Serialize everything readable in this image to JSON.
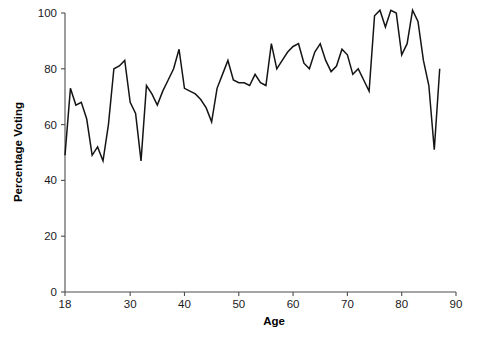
{
  "chart_data": {
    "type": "line",
    "title": "",
    "xlabel": "Age",
    "ylabel": "Percentage Voting",
    "xlim": [
      18,
      90
    ],
    "ylim": [
      0,
      100
    ],
    "grid": false,
    "legend": null,
    "xticks": [
      18,
      30,
      40,
      50,
      60,
      70,
      80,
      90
    ],
    "xtick_labels": [
      "18",
      "30",
      "40",
      "50",
      "60",
      "70",
      "80",
      "90"
    ],
    "yticks": [
      0,
      20,
      40,
      60,
      80,
      100
    ],
    "ytick_labels": [
      "0",
      "20",
      "40",
      "60",
      "80",
      "100"
    ],
    "series": [
      {
        "name": "Percentage Voting",
        "color": "#141414",
        "x": [
          18,
          19,
          20,
          21,
          22,
          23,
          24,
          25,
          26,
          27,
          28,
          29,
          30,
          31,
          32,
          33,
          34,
          35,
          36,
          37,
          38,
          39,
          40,
          41,
          42,
          43,
          44,
          45,
          46,
          47,
          48,
          49,
          50,
          51,
          52,
          53,
          54,
          55,
          56,
          57,
          58,
          59,
          60,
          61,
          62,
          63,
          64,
          65,
          66,
          67,
          68,
          69,
          70,
          71,
          72,
          73,
          74,
          75,
          76,
          77,
          78,
          79,
          80,
          81,
          82,
          83,
          84,
          85,
          86,
          87
        ],
        "values": [
          49,
          73,
          67,
          68,
          62,
          49,
          52,
          47,
          60,
          80,
          81,
          83,
          68,
          64,
          47,
          74,
          71,
          67,
          72,
          76,
          80,
          87,
          73,
          72,
          71,
          69,
          66,
          61,
          73,
          78,
          83,
          76,
          75,
          75,
          74,
          78,
          75,
          74,
          89,
          80,
          83,
          86,
          88,
          89,
          82,
          80,
          86,
          89,
          83,
          79,
          81,
          87,
          85,
          78,
          80,
          76,
          72,
          99,
          101,
          95,
          101,
          100,
          85,
          89,
          101,
          97,
          83,
          74,
          51,
          80
        ]
      }
    ]
  },
  "axis": {
    "x_title": "Age",
    "y_title": "Percentage Voting"
  }
}
